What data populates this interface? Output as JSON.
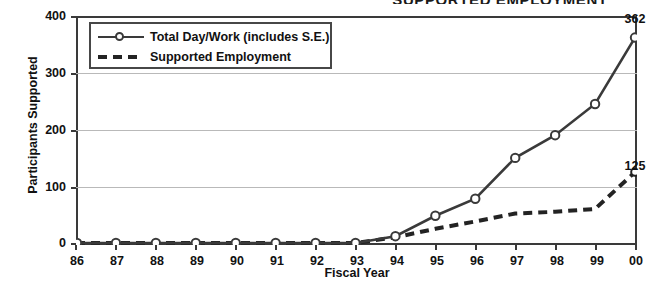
{
  "chart_data": {
    "type": "line",
    "title": "SUPPORTED EMPLOYMENT",
    "xlabel": "Fiscal Year",
    "ylabel": "Participants Supported",
    "categories": [
      "86",
      "87",
      "88",
      "89",
      "90",
      "91",
      "92",
      "93",
      "94",
      "95",
      "96",
      "97",
      "98",
      "99",
      "00"
    ],
    "ylim": [
      0,
      400
    ],
    "yticks": [
      0,
      100,
      200,
      300,
      400
    ],
    "grid": true,
    "legend_position": "top-left",
    "series": [
      {
        "name": "Total Day/Work (includes S.E.)",
        "style": "solid-with-markers",
        "color": "#3a3a3a",
        "values": [
          0,
          0,
          0,
          0,
          0,
          0,
          0,
          0,
          12,
          48,
          78,
          150,
          190,
          245,
          362
        ],
        "end_label": "362"
      },
      {
        "name": "Supported Employment",
        "style": "dashed",
        "color": "#232323",
        "values": [
          0,
          0,
          0,
          0,
          0,
          0,
          0,
          0,
          10,
          25,
          38,
          52,
          55,
          60,
          125
        ],
        "end_label": "125"
      }
    ]
  },
  "labels": {
    "y_400": "400",
    "y_300": "300",
    "y_200": "200",
    "y_100": "100",
    "y_0": "0",
    "x_86": "86",
    "x_87": "87",
    "x_88": "88",
    "x_89": "89",
    "x_90": "90",
    "x_91": "91",
    "x_92": "92",
    "x_93": "93",
    "x_94": "94",
    "x_95": "95",
    "x_96": "96",
    "x_97": "97",
    "x_98": "98",
    "x_99": "99",
    "x_00": "00"
  },
  "legend": {
    "items": [
      {
        "label": "Total Day/Work (includes S.E.)"
      },
      {
        "label": "Supported Employment"
      }
    ]
  },
  "annotations": {
    "total_end": "362",
    "se_end": "125"
  }
}
